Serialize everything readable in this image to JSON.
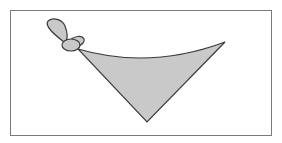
{
  "figure": {
    "colors": {
      "fill": "#c9c9c9",
      "stroke": "#3a3a3a",
      "frame": "#7a7a7a",
      "background": "#ffffff"
    }
  }
}
